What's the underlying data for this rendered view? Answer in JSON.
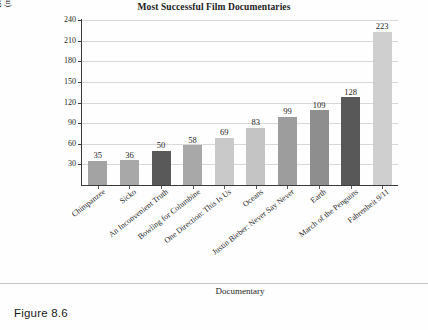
{
  "figure": {
    "caption": "Figure 8.6"
  },
  "chart_data": {
    "type": "bar",
    "title": "Most Successful Film Documentaries",
    "xlabel": "Documentary",
    "ylabel_line1": "Box Office Revenue",
    "ylabel_line2": "(millions of dollars)",
    "categories": [
      "Chimpanzee",
      "Sicko",
      "An Inconvenient Truth",
      "Bowling for Columbine",
      "One Direction: This Is Us",
      "Oceans",
      "Justin Bieber: Never Say Never",
      "Earth",
      "March of the Penguins",
      "Fahrenheit 9/11"
    ],
    "values": [
      35,
      36,
      50,
      58,
      69,
      83,
      99,
      109,
      128,
      223
    ],
    "bar_colors": [
      "#a3a3a3",
      "#a8a8a8",
      "#595959",
      "#a8a8a8",
      "#c9c9c9",
      "#c4c4c4",
      "#9d9d9d",
      "#8e8e8e",
      "#585858",
      "#cfcfcf"
    ],
    "ylim": [
      0,
      240
    ],
    "yticks": [
      30,
      60,
      90,
      120,
      150,
      180,
      210,
      240
    ],
    "ytick_labels": [
      "30",
      "60",
      "90",
      "120",
      "150",
      "180",
      "210",
      "240"
    ],
    "grid": true,
    "legend": "none",
    "value_labels": [
      "35",
      "36",
      "50",
      "58",
      "69",
      "83",
      "99",
      "109",
      "128",
      "223"
    ]
  }
}
